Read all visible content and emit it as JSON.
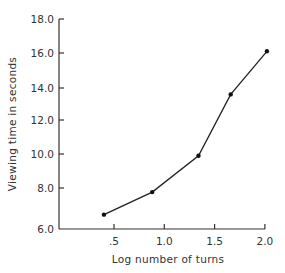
{
  "chart_data": {
    "type": "line",
    "title": "",
    "xlabel": "Log number of turns",
    "ylabel": "Viewing time in seconds",
    "x": [
      0.4,
      0.88,
      1.34,
      1.66,
      2.02
    ],
    "series": [
      {
        "name": "Viewing time",
        "values": [
          6.7,
          7.8,
          9.9,
          13.6,
          16.1
        ]
      }
    ],
    "xticks": [
      ".5",
      "1.0",
      "1.5",
      "2.0"
    ],
    "xtick_values": [
      0.5,
      1.0,
      1.5,
      2.0
    ],
    "yticks": [
      "6.0",
      "8.0",
      "10.0",
      "12.0",
      "14.0",
      "16.0",
      "18.0"
    ],
    "ytick_values": [
      6,
      8,
      10,
      12,
      14,
      16,
      18
    ],
    "xlim": [
      0.05,
      2.0
    ],
    "ylim": [
      6.0,
      18.0
    ],
    "grid": false,
    "legend": "none",
    "line_color": "#222222",
    "marker": "filled-circle"
  }
}
